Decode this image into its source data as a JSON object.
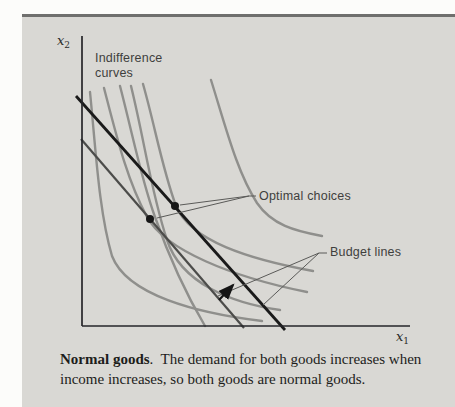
{
  "figure": {
    "axis_labels": {
      "y": {
        "base": "x",
        "sub": "2"
      },
      "x": {
        "base": "x",
        "sub": "1"
      }
    },
    "annotations": {
      "indifference_curves": "Indifference\ncurves",
      "optimal_choices": "Optimal choices",
      "budget_lines": "Budget lines"
    },
    "colors": {
      "panel_background": "#d9d8d4",
      "top_rule": "#6f6f6d",
      "indifference_curve": "#8f8f8c",
      "budget_line_outer": "#1a1a1a",
      "budget_line_inner": "#4c4c4a",
      "axis": "#26262a",
      "pointer": "#5a5a58",
      "dot": "#161616",
      "arrow": "#151515"
    },
    "optimal_choice_points": [
      {
        "x": 150,
        "y": 219
      },
      {
        "x": 175,
        "y": 206
      }
    ]
  },
  "caption": {
    "title": "Normal goods",
    "line1": ".  The demand for both goods increases when",
    "line2": "income increases, so both goods are normal goods."
  }
}
